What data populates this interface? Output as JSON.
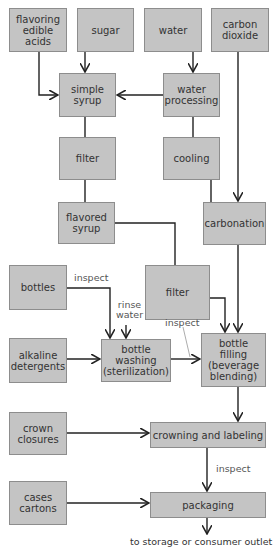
{
  "diagram": {
    "nodes": [
      {
        "id": "flavoring",
        "label": "flavoring\nedible acids"
      },
      {
        "id": "sugar",
        "label": "sugar"
      },
      {
        "id": "water",
        "label": "water"
      },
      {
        "id": "co2",
        "label": "carbon\ndioxide"
      },
      {
        "id": "simple_syrup",
        "label": "simple\nsyrup"
      },
      {
        "id": "water_processing",
        "label": "water\nprocessing"
      },
      {
        "id": "filter1",
        "label": "filter"
      },
      {
        "id": "cooling",
        "label": "cooling"
      },
      {
        "id": "flavored_syrup",
        "label": "flavored\nsyrup"
      },
      {
        "id": "carbonation",
        "label": "carbonation"
      },
      {
        "id": "bottles",
        "label": "bottles"
      },
      {
        "id": "filter2",
        "label": "filter"
      },
      {
        "id": "alkaline",
        "label": "alkaline\ndetergents"
      },
      {
        "id": "bottle_washing",
        "label": "bottle\nwashing\n(sterilization)"
      },
      {
        "id": "bottle_filling",
        "label": "bottle\nfilling\n(beverage\nblending)"
      },
      {
        "id": "crown_closures",
        "label": "crown\nclosures"
      },
      {
        "id": "crowning",
        "label": "crowning and labeling"
      },
      {
        "id": "cases",
        "label": "cases\ncartons"
      },
      {
        "id": "packaging",
        "label": "packaging"
      }
    ],
    "annotations": {
      "inspect_bottles": "inspect",
      "rinse_water": "rinse\nwater",
      "inspect_washing": "inspect",
      "inspect_crowning": "inspect",
      "outlet": "to storage or consumer outlet"
    },
    "edges": [
      [
        "flavoring",
        "simple_syrup"
      ],
      [
        "sugar",
        "simple_syrup"
      ],
      [
        "water",
        "water_processing"
      ],
      [
        "water_processing",
        "simple_syrup"
      ],
      [
        "water_processing",
        "cooling"
      ],
      [
        "simple_syrup",
        "filter1"
      ],
      [
        "filter1",
        "flavored_syrup"
      ],
      [
        "flavored_syrup",
        "filter2"
      ],
      [
        "cooling",
        "carbonation"
      ],
      [
        "co2",
        "carbonation"
      ],
      [
        "filter2",
        "bottle_filling"
      ],
      [
        "carbonation",
        "bottle_filling"
      ],
      [
        "bottles",
        "bottle_washing"
      ],
      [
        "alkaline",
        "bottle_washing"
      ],
      [
        "bottle_washing",
        "bottle_filling"
      ],
      [
        "bottle_filling",
        "crowning"
      ],
      [
        "crown_closures",
        "crowning"
      ],
      [
        "crowning",
        "packaging"
      ],
      [
        "cases",
        "packaging"
      ]
    ]
  }
}
